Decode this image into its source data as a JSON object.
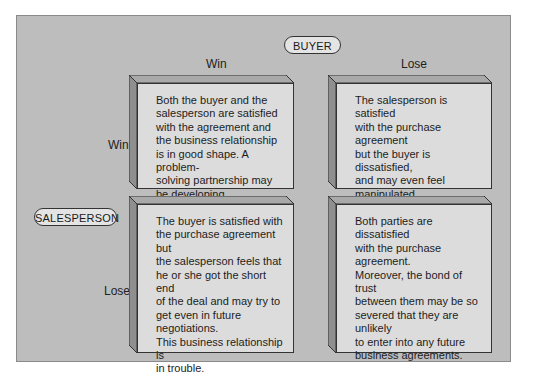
{
  "diagram": {
    "buyer_label": "BUYER",
    "salesperson_label": "SALESPERSON",
    "columns": [
      "Win",
      "Lose"
    ],
    "rows": [
      "Win",
      "Lose"
    ],
    "cells": [
      {
        "salesperson": "Win",
        "buyer": "Win",
        "text": "Both the buyer and the\nsalesperson are satisfied\nwith the agreement and\nthe business relationship\nis in good shape.  A problem-\nsolving partnership may\nbe developing."
      },
      {
        "salesperson": "Win",
        "buyer": "Lose",
        "text": "The salesperson is satisfied\nwith the purchase agreement\nbut the buyer is dissatisfied,\nand may even feel manipulated\nor taken advantage of, so\nthe business relationship is\nin trouble."
      },
      {
        "salesperson": "Lose",
        "buyer": "Win",
        "text": "The buyer is satisfied with\nthe purchase agreement but\nthe salesperson feels that\nhe or she got the short end\nof the deal and may try to\nget even in future negotiations.\nThis business relationship is\nin trouble."
      },
      {
        "salesperson": "Lose",
        "buyer": "Lose",
        "text": "Both parties are dissatisfied\nwith the purchase agreement.\nMoreover, the bond of trust\nbetween them may be so\nsevered that they are unlikely\nto enter into any future\nbusiness agreements."
      }
    ],
    "colors": {
      "panel": "#bdbdbd",
      "box_face": "#dcdcdc",
      "box_top": "#a9a9a9",
      "box_side": "#8f8f8f",
      "pill": "#e4e4e4"
    }
  }
}
